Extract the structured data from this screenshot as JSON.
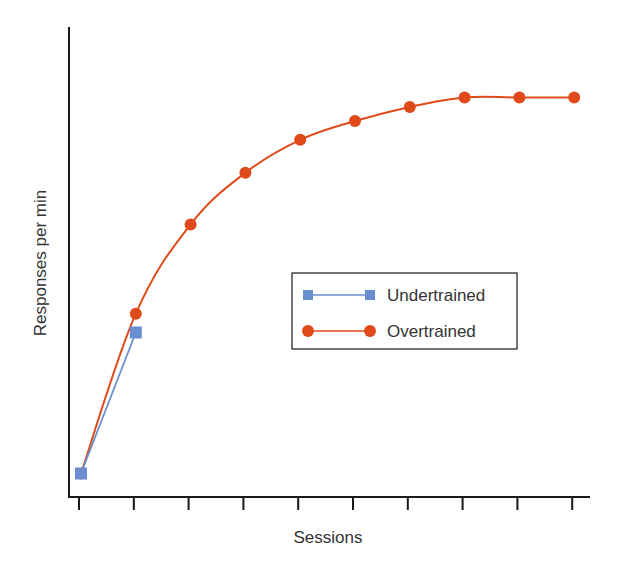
{
  "chart_data": {
    "type": "line",
    "title": "",
    "xlabel": "Sessions",
    "ylabel": "Responses per min",
    "x": [
      1,
      2,
      3,
      4,
      5,
      6,
      7,
      8,
      9,
      10
    ],
    "x_tick_labels": [
      "",
      "",
      "",
      "",
      "",
      "",
      "",
      "",
      "",
      ""
    ],
    "y_tick_labels": [],
    "ylim": [
      0,
      100
    ],
    "xlim": [
      0.8,
      10.8
    ],
    "grid": false,
    "legend_position": "center-right, inside plot",
    "series": [
      {
        "name": "Undertrained",
        "marker": "square",
        "color": "#6a8fd0",
        "line": "straight",
        "x": [
          1,
          2
        ],
        "values": [
          5,
          35
        ]
      },
      {
        "name": "Overtrained",
        "marker": "circle",
        "color": "#e04a1a",
        "line": "smooth",
        "x": [
          1,
          2,
          3,
          4,
          5,
          6,
          7,
          8,
          9,
          10
        ],
        "values": [
          5,
          39,
          58,
          69,
          76,
          80,
          83,
          85,
          85,
          85
        ]
      }
    ],
    "annotations": []
  },
  "colors": {
    "undertrained": "#6a8fd0",
    "overtrained": "#e04a1a",
    "axis": "#1a1a1a",
    "text": "#333333"
  },
  "legend": {
    "items": [
      {
        "label": "Undertrained",
        "marker": "square"
      },
      {
        "label": "Overtrained",
        "marker": "circle"
      }
    ]
  }
}
